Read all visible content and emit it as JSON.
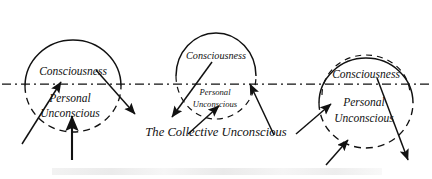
{
  "figure": {
    "title": "The Collective Unconscious",
    "caption_band_text": "",
    "background_color": "#ffffff",
    "ink_color": "#111111",
    "width": 432,
    "height": 179
  },
  "collective": {
    "label": "The Collective Unconscious",
    "label_x": 216,
    "label_y": 133,
    "baseline_y": 84,
    "line_style": "dash-dot",
    "line_x_start": 2,
    "line_x_end": 430
  },
  "psyches": [
    {
      "id": "left",
      "center_x": 73,
      "center_y": 86,
      "radius_x": 48,
      "radius_y": 46,
      "consciousness_label": "Consciousness",
      "consciousness_label_x": 73,
      "consciousness_label_y": 72,
      "consciousness_label_size": "large",
      "personal_unconscious_label_line1": "Personal",
      "personal_unconscious_label_line2": "Unconscious",
      "personal_unconscious_label_x": 70,
      "personal_unconscious_label_y1": 99,
      "personal_unconscious_label_y2": 114,
      "personal_unconscious_label_size": "large",
      "upper_arc_style": "solid",
      "lower_arc_style": "dashed"
    },
    {
      "id": "middle",
      "center_x": 216,
      "center_y": 76,
      "radius_x": 40,
      "radius_y": 43,
      "consciousness_label": "Consciousness",
      "consciousness_label_x": 216,
      "consciousness_label_y": 57,
      "consciousness_label_size": "small",
      "personal_unconscious_label_line1": "Personal",
      "personal_unconscious_label_line2": "Unconscious",
      "personal_unconscious_label_x": 215,
      "personal_unconscious_label_y1": 93,
      "personal_unconscious_label_y2": 105,
      "personal_unconscious_label_size": "small",
      "upper_arc_style": "solid",
      "lower_arc_style": "dashed"
    },
    {
      "id": "right",
      "center_x": 366,
      "center_y": 103,
      "radius_x": 47,
      "radius_y": 45,
      "consciousness_label": "Consciousness",
      "consciousness_label_x": 366,
      "consciousness_label_y": 75,
      "consciousness_label_size": "large",
      "personal_unconscious_label_line1": "Personal",
      "personal_unconscious_label_line2": "Unconscious",
      "personal_unconscious_label_x": 364,
      "personal_unconscious_label_y1": 103,
      "personal_unconscious_label_y2": 119,
      "personal_unconscious_label_size": "large",
      "upper_arc_style": "solid",
      "lower_arc_style": "dashed"
    }
  ],
  "arrows": [
    {
      "id": "left-inbound-diagonal",
      "direction": "up-right",
      "x1": 22,
      "y1": 144,
      "x2": 61,
      "y2": 82
    },
    {
      "id": "left-inbound-vertical",
      "direction": "up",
      "x1": 72,
      "y1": 160,
      "x2": 72,
      "y2": 116
    },
    {
      "id": "left-outbound-diagonal",
      "direction": "down-right",
      "x1": 96,
      "y1": 70,
      "x2": 135,
      "y2": 114
    },
    {
      "id": "middle-outbound-diagonal",
      "direction": "down-left",
      "x1": 212,
      "y1": 62,
      "x2": 172,
      "y2": 117
    },
    {
      "id": "middle-inbound-lower",
      "direction": "up-right",
      "x1": 188,
      "y1": 134,
      "x2": 219,
      "y2": 106
    },
    {
      "id": "middle-inbound-right",
      "direction": "up-left",
      "x1": 274,
      "y1": 135,
      "x2": 250,
      "y2": 84
    },
    {
      "id": "right-inbound-upper",
      "direction": "up-right",
      "x1": 296,
      "y1": 134,
      "x2": 331,
      "y2": 104
    },
    {
      "id": "right-inbound-lower",
      "direction": "up-right",
      "x1": 326,
      "y1": 165,
      "x2": 348,
      "y2": 140
    },
    {
      "id": "right-outbound-diagonal",
      "direction": "down-right",
      "x1": 377,
      "y1": 78,
      "x2": 408,
      "y2": 160
    }
  ]
}
